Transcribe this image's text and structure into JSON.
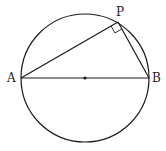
{
  "diagram": {
    "type": "geometry",
    "stroke_color": "#1a1a1a",
    "circle": {
      "cx": 85,
      "cy": 78,
      "r": 64
    },
    "center_dot": {
      "x": 85,
      "y": 78
    },
    "points": {
      "A": {
        "label": "A",
        "x": 21,
        "y": 78
      },
      "B": {
        "label": "B",
        "x": 149,
        "y": 78
      },
      "P": {
        "label": "P",
        "x": 118,
        "y": 22
      }
    },
    "segments": [
      {
        "from": "A",
        "to": "B",
        "note": "diameter"
      },
      {
        "from": "A",
        "to": "P"
      },
      {
        "from": "P",
        "to": "B"
      }
    ],
    "right_angle_marker": {
      "at": "P"
    }
  }
}
